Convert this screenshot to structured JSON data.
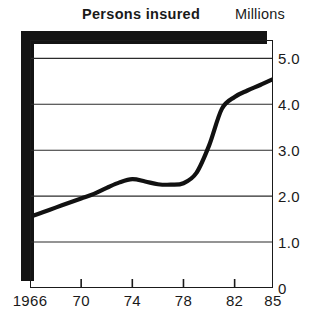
{
  "chart_data": {
    "type": "line",
    "title": "Persons insured",
    "subtitle": "",
    "unit_label": "Millions",
    "xlabel": "",
    "ylabel": "Millions",
    "xlim": [
      1966,
      1985
    ],
    "ylim": [
      0,
      5.4
    ],
    "grid": true,
    "grid_axis": "y",
    "legend": false,
    "legend_position": "none",
    "line_color": "#111111",
    "x_tick_labels": [
      "1966",
      "70",
      "74",
      "78",
      "82",
      "85"
    ],
    "x_tick_values": [
      1966,
      1970,
      1974,
      1978,
      1982,
      1985
    ],
    "y_tick_labels": [
      "0",
      "1.0",
      "2.0",
      "3.0",
      "4.0",
      "5.0"
    ],
    "y_tick_values": [
      0,
      1.0,
      2.0,
      3.0,
      4.0,
      5.0
    ],
    "series": [
      {
        "name": "Persons insured",
        "x": [
          1966,
          1967,
          1968,
          1969,
          1970,
          1971,
          1972,
          1973,
          1974,
          1975,
          1976,
          1977,
          1978,
          1979,
          1980,
          1981,
          1982,
          1983,
          1984,
          1985
        ],
        "values": [
          1.55,
          1.65,
          1.75,
          1.85,
          1.95,
          2.05,
          2.18,
          2.3,
          2.37,
          2.32,
          2.26,
          2.25,
          2.28,
          2.5,
          3.1,
          3.9,
          4.16,
          4.3,
          4.42,
          4.55
        ]
      }
    ]
  },
  "axes": {
    "y_ticks": [
      {
        "label": "5.0",
        "value": 5.0
      },
      {
        "label": "4.0",
        "value": 4.0
      },
      {
        "label": "3.0",
        "value": 3.0
      },
      {
        "label": "2.0",
        "value": 2.0
      },
      {
        "label": "1.0",
        "value": 1.0
      },
      {
        "label": "0",
        "value": 0
      }
    ],
    "x_ticks": [
      {
        "label": "1966",
        "value": 1966
      },
      {
        "label": "70",
        "value": 1970
      },
      {
        "label": "74",
        "value": 1974
      },
      {
        "label": "78",
        "value": 1978
      },
      {
        "label": "82",
        "value": 1982
      },
      {
        "label": "85",
        "value": 1985
      }
    ]
  }
}
